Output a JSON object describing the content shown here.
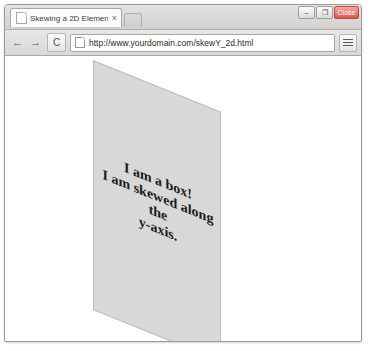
{
  "window": {
    "controls": [
      {
        "name": "minimize",
        "label": "–"
      },
      {
        "name": "maximize",
        "label": "❐"
      },
      {
        "name": "close",
        "label": "Close"
      }
    ]
  },
  "tabs": [
    {
      "title": "Skewing a 2D Element Alo",
      "favicon": "page-icon",
      "close_label": "×"
    }
  ],
  "new_tab": {
    "label": ""
  },
  "toolbar": {
    "back_label": "←",
    "forward_label": "→",
    "reload_label": "C",
    "menu_label": "menu",
    "omnibox": {
      "url": "http://www.yourdomain.com/skewY_2d.html",
      "placeholder": "Search Google or type URL",
      "page_icon": "document-icon"
    }
  },
  "page": {
    "box": {
      "text": "I am a box! I am skewed along the y-axis.",
      "line1": "I am a box!",
      "line2": "I am skewed along the",
      "line3": "y-axis.",
      "background_color": "#d8d8d8",
      "border_color": "#b9b9b9",
      "transform": "skewY(22deg)"
    }
  }
}
